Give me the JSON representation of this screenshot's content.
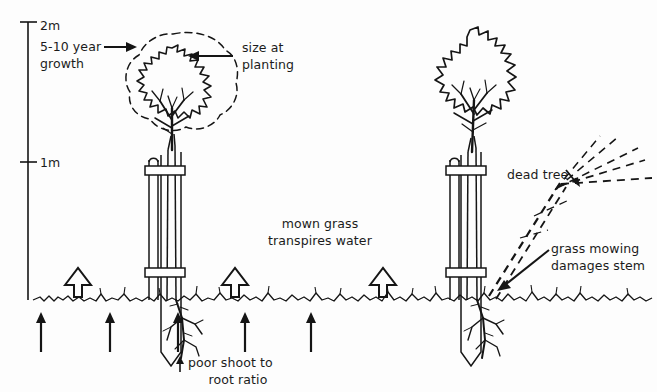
{
  "diagram": {
    "background_color": "#fdfdfd",
    "ink_color": "#1b1b1b"
  },
  "scale": {
    "name": "vertical-height-scale",
    "ticks": [
      {
        "label": "2m",
        "value": 2,
        "y": 22
      },
      {
        "label": "1m",
        "value": 1,
        "y": 162
      }
    ],
    "unit": "m"
  },
  "labels": {
    "growth": "5-10 year\ngrowth",
    "growth_line1": "5-10 year",
    "growth_line2": "growth",
    "size_at_planting_line1": "size at",
    "size_at_planting_line2": "planting",
    "mown_grass_line1": "mown grass",
    "mown_grass_line2": "transpires water",
    "poor_ratio_line1": "poor shoot to",
    "poor_ratio_line2": "root ratio",
    "dead_tree": "dead tree",
    "grass_mowing_line1": "grass mowing",
    "grass_mowing_line2": "damages stem"
  },
  "elements": {
    "left_tree": {
      "name": "young-staked-tree",
      "canopy_solid": "size at planting",
      "canopy_dashed": "5-10 year growth projection",
      "stakes": 2,
      "tie_bands": 2
    },
    "right_tree": {
      "name": "mature-staked-tree",
      "canopy_solid": "grown canopy",
      "stakes": 2,
      "tie_bands": 2
    },
    "dead_tree": {
      "name": "dead-tree-dashed",
      "style": "dashed",
      "description": "fallen dashed tree outline"
    },
    "ground_line": {
      "name": "grass-ground-line",
      "y": 298
    },
    "hollow_arrows": {
      "name": "transpiration-arrows",
      "count": 3,
      "direction": "up",
      "x_positions": [
        78,
        235,
        383
      ]
    },
    "soil_arrows": {
      "name": "soil-water-uptake-arrows",
      "count": 5,
      "direction": "up",
      "x_positions": [
        41,
        110,
        178,
        245,
        311
      ]
    }
  }
}
